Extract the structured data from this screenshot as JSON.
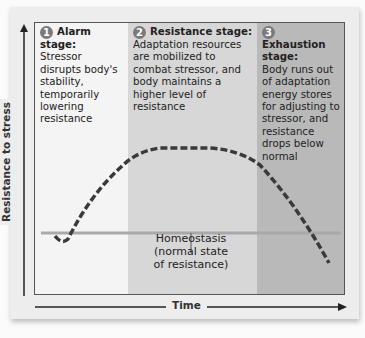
{
  "diagram": {
    "y_axis_label": "Resistance to stress",
    "x_axis_label": "Time",
    "stages": [
      {
        "number": "1",
        "title": "Alarm stage:",
        "description": "Stressor disrupts body's stability, temporarily lowering resistance",
        "color": "#f4f4f4"
      },
      {
        "number": "2",
        "title": "Resistance stage:",
        "description": "Adaptation resources are mobilized to combat stressor, and body maintains a higher level of resistance",
        "color": "#d7d7d7"
      },
      {
        "number": "3",
        "title": "Exhaustion stage:",
        "description": "Body runs out of adaptation energy stores for adjusting to stressor, and resistance drops below normal",
        "color": "#b9b9b9"
      }
    ],
    "baseline_label_line1": "Homeostasis",
    "baseline_label_line2": "(normal state",
    "baseline_label_line3": "of resistance)",
    "curve_style": "dashed",
    "baseline_color": "#a9a9a9",
    "curve_color": "#3a3a3a"
  }
}
